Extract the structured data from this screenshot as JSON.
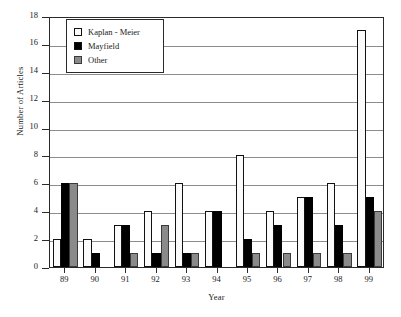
{
  "chart_data": {
    "type": "bar",
    "title": "",
    "xlabel": "Year",
    "ylabel": "Number of Articles",
    "ylim": [
      0,
      18
    ],
    "ytick_values": [
      0,
      2,
      4,
      6,
      8,
      10,
      12,
      14,
      16,
      18
    ],
    "ytick_labels": [
      "0",
      "2",
      "4",
      "6",
      "8",
      "10",
      "12",
      "14",
      "16",
      "18"
    ],
    "grid": true,
    "grid_axis": "y",
    "legend_position": "upper left",
    "categories": [
      "89",
      "90",
      "91",
      "92",
      "93",
      "94",
      "95",
      "96",
      "97",
      "98",
      "99"
    ],
    "series": [
      {
        "name": "Kaplan - Meier",
        "color": "#fbfbfb",
        "values": [
          2,
          2,
          3,
          4,
          6,
          4,
          8,
          4,
          5,
          6,
          17
        ]
      },
      {
        "name": "Mayfield",
        "color": "#000000",
        "values": [
          6,
          1,
          3,
          1,
          1,
          4,
          2,
          3,
          5,
          3,
          5
        ]
      },
      {
        "name": "Other",
        "color": "#8a8a8a",
        "values": [
          6,
          0,
          1,
          3,
          1,
          0,
          1,
          1,
          1,
          1,
          4
        ]
      }
    ]
  },
  "legend": {
    "items": [
      {
        "label": "Kaplan - Meier",
        "swatch": "km"
      },
      {
        "label": "Mayfield",
        "swatch": "mf"
      },
      {
        "label": "Other",
        "swatch": "ot"
      }
    ]
  }
}
